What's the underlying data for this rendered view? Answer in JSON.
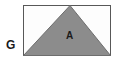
{
  "figure": {
    "type": "geometry-diagram",
    "background_color": "#ffffff",
    "rectangle": {
      "name": "outer-rectangle",
      "x": 23.5,
      "y": 5.5,
      "width": 87,
      "height": 50,
      "fill_color": "#fdfdfd",
      "stroke_color": "#585858",
      "stroke_width": 1
    },
    "triangle": {
      "name": "inscribed-triangle",
      "points": "23.5,55.5 110.5,55.5 70,5.5",
      "fill_color": "#8c8c8c",
      "stroke_color": "#6e6e6e",
      "stroke_width": 1,
      "apex_x": 70
    },
    "labels": {
      "region_label": "A",
      "figure_label": "G"
    }
  }
}
